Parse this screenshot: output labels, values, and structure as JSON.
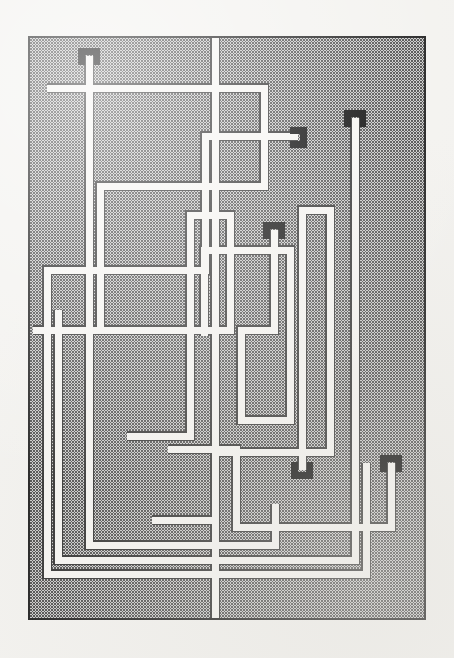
{
  "artwork": {
    "title": "Untitled maze composition",
    "medium_note": "halftone screen field with routed white channels",
    "canvas": {
      "width": 454,
      "height": 658,
      "background": "#f3f2ef"
    },
    "plate": {
      "x": 28,
      "y": 36,
      "width": 398,
      "height": 584,
      "fill": "#b6b6b6",
      "border_color": "#1a1a1a",
      "border_width": 1.6,
      "halftone_dot_color": "#3a3a3a",
      "halftone_pitch": 3
    },
    "channel": {
      "fill": "#f6f5f2",
      "stroke": "#2a2a2a",
      "stroke_width": 1.1,
      "width": 7,
      "cap_color": "#050505",
      "cap_width": 21,
      "cap_depth": 16
    },
    "counts": {
      "terminal_caps": 6,
      "channels": 9
    },
    "caps": [
      {
        "id": "cap-top-left",
        "x": 89,
        "y": 56,
        "orientation": "down"
      },
      {
        "id": "cap-upper-right",
        "x": 298,
        "y": 136,
        "orientation": "left"
      },
      {
        "id": "cap-right-tall",
        "x": 355,
        "y": 118,
        "orientation": "down"
      },
      {
        "id": "cap-center",
        "x": 274,
        "y": 230,
        "orientation": "down"
      },
      {
        "id": "cap-bottom-mid",
        "x": 302,
        "y": 470,
        "orientation": "up"
      },
      {
        "id": "cap-bottom-right",
        "x": 391,
        "y": 463,
        "orientation": "down"
      }
    ],
    "channel_paths": [
      {
        "id": "channel-a",
        "label": "top-left terminal sweep",
        "d": "M89 56 L89 545 L275 545 L275 504"
      },
      {
        "id": "channel-b",
        "label": "upper loop to left margin",
        "d": "M298 136 L205 136 L205 270 L47 270 L47 574 L366 574 L366 463"
      },
      {
        "id": "channel-c",
        "label": "broad upper rectangle",
        "d": "M47 88 L264 88 L264 186 L100 186 L100 330"
      },
      {
        "id": "channel-d",
        "label": "right tall column",
        "d": "M355 118 L355 560 L58 560 L58 310"
      },
      {
        "id": "channel-e",
        "label": "center descending hook",
        "d": "M274 230 L274 330 L241 330 L241 420 L290 420 L290 250 L204 250 L204 336"
      },
      {
        "id": "channel-f",
        "label": "mid crossbar",
        "d": "M33 330 L230 330 L230 215 L190 215 L190 436 L127 436"
      },
      {
        "id": "channel-g",
        "label": "bottom right return",
        "d": "M302 470 L302 210 L330 210 L330 452 L215 452 L215 520 L152 520"
      },
      {
        "id": "channel-h",
        "label": "bottom right outer ring",
        "d": "M391 463 L391 527 L236 527 L236 449 L168 449"
      },
      {
        "id": "channel-i",
        "label": "full height spine",
        "d": "M215 36 L215 620"
      }
    ]
  }
}
